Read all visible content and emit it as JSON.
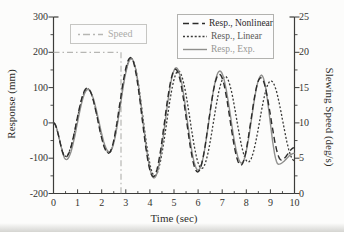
{
  "chart_data": {
    "type": "line",
    "title": "",
    "x_axis": {
      "label": "Time (sec)",
      "min": 0,
      "max": 10,
      "major_ticks": [
        0,
        1,
        2,
        3,
        4,
        5,
        6,
        7,
        8,
        9,
        10
      ],
      "minor_step": 0.5
    },
    "y_left": {
      "label": "Response (mm)",
      "min": -200,
      "max": 300,
      "major_ticks": [
        300,
        200,
        100,
        0,
        -100,
        -200
      ],
      "minor_step": 50
    },
    "y_right": {
      "label": "Slewing Speed (deg/s)",
      "min": 0,
      "max": 25,
      "major_ticks": [
        25,
        20,
        15,
        10,
        5,
        0
      ],
      "minor_step": 2.5
    },
    "grid": false,
    "colors": {
      "axis": "#3c3c3a",
      "tick_text": "#33332f",
      "background": "#fcfcfb"
    },
    "series": [
      {
        "id": "speed",
        "name": "Speed",
        "axis": "right",
        "style": "dash-dot",
        "color": "#b6b6b3",
        "dash": "6 3 1.5 3",
        "width": 1.2,
        "interpolation": "linear",
        "points": [
          [
            0,
            20
          ],
          [
            2.8,
            20
          ],
          [
            2.8,
            0
          ]
        ]
      },
      {
        "id": "linear",
        "name": "Resp., Linear",
        "axis": "left",
        "style": "dotted",
        "color": "#3a3a38",
        "dash": "2 1.9",
        "width": 1.3,
        "interpolation": "cosine-extrema",
        "points": [
          [
            0,
            0
          ],
          [
            0.5,
            -95
          ],
          [
            1.41,
            97
          ],
          [
            2.3,
            -85
          ],
          [
            3.22,
            183
          ],
          [
            4.2,
            -150
          ],
          [
            5.18,
            147
          ],
          [
            6.15,
            -129
          ],
          [
            7.12,
            132
          ],
          [
            8.08,
            -111
          ],
          [
            9.02,
            119
          ],
          [
            10,
            -107
          ]
        ]
      },
      {
        "id": "exp",
        "name": "Resp., Exp.",
        "axis": "left",
        "style": "solid",
        "color": "#8f8f8d",
        "dash": "",
        "width": 1.4,
        "interpolation": "cosine-extrema",
        "points": [
          [
            0,
            0
          ],
          [
            0.53,
            -104
          ],
          [
            1.43,
            95
          ],
          [
            2.32,
            -82
          ],
          [
            3.23,
            182
          ],
          [
            4.17,
            -156
          ],
          [
            5.09,
            156
          ],
          [
            6.0,
            -134
          ],
          [
            6.9,
            147
          ],
          [
            7.8,
            -114
          ],
          [
            8.63,
            135
          ],
          [
            9.33,
            -117
          ],
          [
            10,
            -86
          ]
        ]
      },
      {
        "id": "nonlinear",
        "name": "Resp., Nonlinear",
        "axis": "left",
        "style": "dashed",
        "color": "#2b2b2a",
        "dash": "6 3.5",
        "width": 1.4,
        "interpolation": "cosine-extrema",
        "points": [
          [
            0,
            0
          ],
          [
            0.5,
            -97
          ],
          [
            1.4,
            99
          ],
          [
            2.28,
            -86
          ],
          [
            3.2,
            185
          ],
          [
            4.14,
            -152
          ],
          [
            5.06,
            152
          ],
          [
            5.98,
            -139
          ],
          [
            6.88,
            138
          ],
          [
            7.77,
            -120
          ],
          [
            8.6,
            128
          ],
          [
            9.45,
            -105
          ],
          [
            10,
            -70
          ]
        ]
      }
    ],
    "legend_main": {
      "position": "top-right",
      "items": [
        {
          "label": "Resp., Nonlinear",
          "color": "#2b2b2a",
          "dash": "6 3.5",
          "label_style": "color:#2b2b2a"
        },
        {
          "label": "Resp., Linear",
          "color": "#3a3a38",
          "dash": "2 1.9",
          "label_style": "color:#5a5a57"
        },
        {
          "label": "Resp., Exp.",
          "color": "#8f8f8d",
          "dash": "",
          "label_style": "color:#979794"
        }
      ]
    },
    "legend_speed": {
      "position": "top-left",
      "item": {
        "label": "Speed",
        "color": "#b6b6b3",
        "dash": "2 3 7 3",
        "label_style": "color:#ababa8"
      }
    }
  }
}
